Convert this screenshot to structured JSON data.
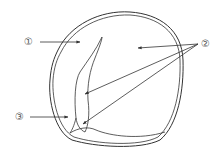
{
  "diagram": {
    "title": "",
    "labels": [
      {
        "id": "1",
        "text": "①",
        "x": 24,
        "y": 37
      },
      {
        "id": "2",
        "text": "②",
        "x": 201,
        "y": 39
      },
      {
        "id": "3",
        "text": "③",
        "x": 15,
        "y": 112
      }
    ],
    "colors": {
      "stroke": "#333333",
      "label": "#555555"
    }
  }
}
